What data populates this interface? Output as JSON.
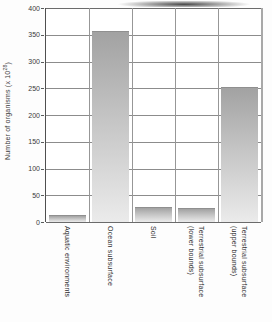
{
  "chart_data": {
    "type": "bar",
    "title": "",
    "categories": [
      "Aquatic environments",
      "Ocean subsurface",
      "Soil",
      "Terrestrial subsurface\n(lower bounds)",
      "Terrestrial subsurface\n(upper bounds)"
    ],
    "values": [
      12,
      355,
      26,
      25,
      250
    ],
    "xlabel": "",
    "ylabel": "Number of organisms (x 10^28)",
    "ylabel_base": "Number of organisms (x 10",
    "ylabel_superscript": "28",
    "ylabel_close": ")",
    "ylim": [
      0,
      400
    ],
    "ytick_interval": 50,
    "ytick_labels": [
      "400",
      "350",
      "300",
      "250",
      "200",
      "150",
      "100",
      "50",
      "0"
    ],
    "grid": true,
    "legend": false,
    "colors": {
      "bar_gradient_top": "#a2a2a2",
      "bar_gradient_bottom": "#ebebeb",
      "gridline": "#8c8c8c",
      "axis": "#4f4f4f",
      "text": "#3a3a3a",
      "plot_background": "#ffffff"
    }
  }
}
